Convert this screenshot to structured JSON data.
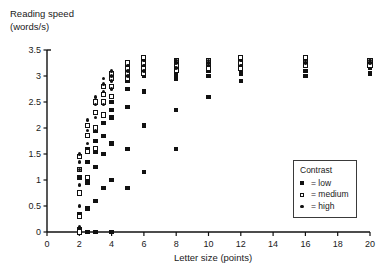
{
  "chart_data": {
    "type": "scatter",
    "title": "",
    "ylabel": "Reading speed\n(words/s)",
    "ylabel_line1": "Reading speed",
    "ylabel_line2": "(words/s)",
    "xlabel": "Letter size (points)",
    "xlim": [
      0,
      20
    ],
    "ylim": [
      0,
      3.5
    ],
    "xticks": [
      0,
      2,
      4,
      6,
      8,
      10,
      12,
      14,
      16,
      18,
      20
    ],
    "yticks": [
      0,
      0.5,
      1,
      1.5,
      2,
      2.5,
      3,
      3.5
    ],
    "xtick_labels": [
      "0",
      "2",
      "4",
      "6",
      "8",
      "10",
      "12",
      "14",
      "16",
      "18",
      "20"
    ],
    "ytick_labels": [
      "0",
      "0.5",
      "1",
      "1.5",
      "2",
      "2.5",
      "3",
      "3.5"
    ],
    "grid": false,
    "legend": {
      "title": "Contrast",
      "position": "lower-right",
      "entries": [
        {
          "symbol": "filled-square",
          "marker_class": "low",
          "sym_label": "■",
          "label": "= low",
          "name": "low"
        },
        {
          "symbol": "open-square",
          "marker_class": "medium",
          "sym_label": "□",
          "label": "= medium",
          "name": "medium"
        },
        {
          "symbol": "filled-circle",
          "marker_class": "high",
          "sym_label": "•",
          "label": "= high",
          "name": "high"
        }
      ]
    },
    "series": [
      {
        "name": "low",
        "marker": "filled-square",
        "color": "#111111",
        "points": [
          [
            2.0,
            0.0
          ],
          [
            2.0,
            0.05
          ],
          [
            2.0,
            0.35
          ],
          [
            2.0,
            0.75
          ],
          [
            2.0,
            1.05
          ],
          [
            2.5,
            0.0
          ],
          [
            2.5,
            0.45
          ],
          [
            2.5,
            0.95
          ],
          [
            2.5,
            1.35
          ],
          [
            2.5,
            1.6
          ],
          [
            3.0,
            0.0
          ],
          [
            3.0,
            0.6
          ],
          [
            3.0,
            1.25
          ],
          [
            3.0,
            1.55
          ],
          [
            3.0,
            1.75
          ],
          [
            3.0,
            1.95
          ],
          [
            3.5,
            0.85
          ],
          [
            3.5,
            1.5
          ],
          [
            3.5,
            1.85
          ],
          [
            3.5,
            2.1
          ],
          [
            4.0,
            0.0
          ],
          [
            4.0,
            1.0
          ],
          [
            4.0,
            1.7
          ],
          [
            4.0,
            2.2
          ],
          [
            4.0,
            2.35
          ],
          [
            4.0,
            2.5
          ],
          [
            5.0,
            0.85
          ],
          [
            5.0,
            1.6
          ],
          [
            5.0,
            2.4
          ],
          [
            5.0,
            2.75
          ],
          [
            5.0,
            2.9
          ],
          [
            5.0,
            3.0
          ],
          [
            6.0,
            1.15
          ],
          [
            6.0,
            2.05
          ],
          [
            6.0,
            2.7
          ],
          [
            6.0,
            3.0
          ],
          [
            6.0,
            3.1
          ],
          [
            6.0,
            3.2
          ],
          [
            8.0,
            1.6
          ],
          [
            8.0,
            2.35
          ],
          [
            8.0,
            2.95
          ],
          [
            8.0,
            3.05
          ],
          [
            8.0,
            3.15
          ],
          [
            8.0,
            3.2
          ],
          [
            10.0,
            2.6
          ],
          [
            10.0,
            3.0
          ],
          [
            10.0,
            3.1
          ],
          [
            10.0,
            3.15
          ],
          [
            10.0,
            3.2
          ],
          [
            12.0,
            2.9
          ],
          [
            12.0,
            3.05
          ],
          [
            12.0,
            3.15
          ],
          [
            12.0,
            3.2
          ],
          [
            16.0,
            3.0
          ],
          [
            16.0,
            3.1
          ],
          [
            16.0,
            3.2
          ],
          [
            16.0,
            3.25
          ],
          [
            20.0,
            3.05
          ],
          [
            20.0,
            3.15
          ],
          [
            20.0,
            3.2
          ]
        ]
      },
      {
        "name": "medium",
        "marker": "open-square",
        "color": "#ffffff",
        "edge_color": "#111111",
        "points": [
          [
            2.0,
            0.0
          ],
          [
            2.0,
            0.3
          ],
          [
            2.0,
            0.75
          ],
          [
            2.0,
            1.2
          ],
          [
            2.0,
            1.45
          ],
          [
            2.5,
            1.05
          ],
          [
            2.5,
            1.55
          ],
          [
            2.5,
            1.85
          ],
          [
            2.5,
            2.05
          ],
          [
            3.0,
            1.6
          ],
          [
            3.0,
            2.0
          ],
          [
            3.0,
            2.3
          ],
          [
            3.0,
            2.5
          ],
          [
            3.5,
            2.25
          ],
          [
            3.5,
            2.5
          ],
          [
            3.5,
            2.65
          ],
          [
            3.5,
            2.8
          ],
          [
            4.0,
            2.6
          ],
          [
            4.0,
            2.8
          ],
          [
            4.0,
            2.95
          ],
          [
            4.0,
            3.05
          ],
          [
            5.0,
            2.95
          ],
          [
            5.0,
            3.05
          ],
          [
            5.0,
            3.15
          ],
          [
            5.0,
            3.25
          ],
          [
            6.0,
            3.05
          ],
          [
            6.0,
            3.15
          ],
          [
            6.0,
            3.25
          ],
          [
            6.0,
            3.35
          ],
          [
            8.0,
            3.1
          ],
          [
            8.0,
            3.2
          ],
          [
            8.0,
            3.3
          ],
          [
            10.0,
            3.15
          ],
          [
            10.0,
            3.25
          ],
          [
            10.0,
            3.3
          ],
          [
            12.0,
            3.15
          ],
          [
            12.0,
            3.25
          ],
          [
            12.0,
            3.35
          ],
          [
            16.0,
            3.2
          ],
          [
            16.0,
            3.3
          ],
          [
            16.0,
            3.35
          ],
          [
            20.0,
            3.2
          ],
          [
            20.0,
            3.3
          ]
        ]
      },
      {
        "name": "high",
        "marker": "filled-circle",
        "color": "#111111",
        "points": [
          [
            2.0,
            0.1
          ],
          [
            2.0,
            0.5
          ],
          [
            2.0,
            0.9
          ],
          [
            2.0,
            1.2
          ],
          [
            2.0,
            1.35
          ],
          [
            2.0,
            1.5
          ],
          [
            2.5,
            1.35
          ],
          [
            2.5,
            1.7
          ],
          [
            2.5,
            1.95
          ],
          [
            2.5,
            2.15
          ],
          [
            3.0,
            1.95
          ],
          [
            3.0,
            2.2
          ],
          [
            3.0,
            2.45
          ],
          [
            3.0,
            2.6
          ],
          [
            3.5,
            2.45
          ],
          [
            3.5,
            2.7
          ],
          [
            3.5,
            2.85
          ],
          [
            3.5,
            2.95
          ],
          [
            4.0,
            2.75
          ],
          [
            4.0,
            2.9
          ],
          [
            4.0,
            3.0
          ],
          [
            4.0,
            3.1
          ],
          [
            5.0,
            3.0
          ],
          [
            5.0,
            3.1
          ],
          [
            5.0,
            3.2
          ],
          [
            6.0,
            3.1
          ],
          [
            6.0,
            3.2
          ],
          [
            6.0,
            3.3
          ],
          [
            8.0,
            3.15
          ],
          [
            8.0,
            3.25
          ],
          [
            8.0,
            3.3
          ],
          [
            10.0,
            3.2
          ],
          [
            10.0,
            3.25
          ],
          [
            10.0,
            3.3
          ],
          [
            12.0,
            3.2
          ],
          [
            12.0,
            3.3
          ],
          [
            16.0,
            3.25
          ],
          [
            16.0,
            3.3
          ],
          [
            20.0,
            3.25
          ],
          [
            20.0,
            3.3
          ]
        ]
      }
    ]
  }
}
